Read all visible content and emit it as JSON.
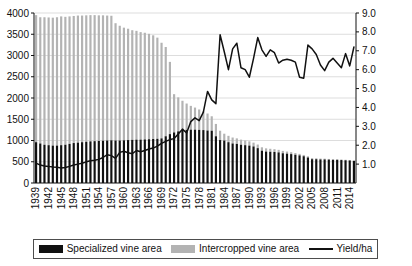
{
  "chart_data": {
    "type": "bar",
    "title": "",
    "subtitle": "",
    "xlabel": "",
    "ylabel": "",
    "y2label": "",
    "grid": true,
    "legend_position": "bottom",
    "stacked": true,
    "ylim": [
      0,
      4000
    ],
    "y2lim": [
      0,
      9.0
    ],
    "ytick_labels": [
      "0",
      "500",
      "1000",
      "1500",
      "2000",
      "2500",
      "3000",
      "3500",
      "4000"
    ],
    "ytick_values": [
      0,
      500,
      1000,
      1500,
      2000,
      2500,
      3000,
      3500,
      4000
    ],
    "y2tick_labels": [
      "1.0",
      "2.0",
      "3.0",
      "4.0",
      "5.0",
      "6.0",
      "7.0",
      "8.0",
      "9.0"
    ],
    "y2tick_values": [
      1.0,
      2.0,
      3.0,
      4.0,
      5.0,
      6.0,
      7.0,
      8.0,
      9.0
    ],
    "xtick_labels": [
      "1939",
      "1942",
      "1945",
      "1948",
      "1951",
      "1954",
      "1957",
      "1960",
      "1963",
      "1966",
      "1969",
      "1972",
      "1975",
      "1978",
      "1981",
      "1984",
      "1987",
      "1990",
      "1993",
      "1996",
      "1999",
      "2002",
      "2005",
      "2008",
      "2011",
      "2014"
    ],
    "categories": [
      1939,
      1940,
      1941,
      1942,
      1943,
      1944,
      1945,
      1946,
      1947,
      1948,
      1949,
      1950,
      1951,
      1952,
      1953,
      1954,
      1955,
      1956,
      1957,
      1958,
      1959,
      1960,
      1961,
      1962,
      1963,
      1964,
      1965,
      1966,
      1967,
      1968,
      1969,
      1970,
      1971,
      1972,
      1973,
      1974,
      1975,
      1976,
      1977,
      1978,
      1979,
      1980,
      1981,
      1982,
      1983,
      1984,
      1985,
      1986,
      1987,
      1988,
      1989,
      1990,
      1991,
      1992,
      1993,
      1994,
      1995,
      1996,
      1997,
      1998,
      1999,
      2000,
      2001,
      2002,
      2003,
      2004,
      2005,
      2006,
      2007,
      2008,
      2009,
      2010,
      2011,
      2012,
      2013,
      2014,
      2015
    ],
    "series": [
      {
        "name": "Specialized vine area",
        "color": "#111111",
        "axis": "left",
        "values": [
          960,
          930,
          900,
          890,
          880,
          880,
          890,
          900,
          920,
          940,
          950,
          960,
          970,
          980,
          985,
          990,
          995,
          1000,
          1005,
          1000,
          1000,
          1005,
          1010,
          1015,
          1020,
          1020,
          1025,
          1030,
          1035,
          1040,
          1050,
          1100,
          1150,
          1190,
          1215,
          1235,
          1250,
          1255,
          1255,
          1250,
          1245,
          1235,
          1230,
          1100,
          1010,
          1000,
          960,
          930,
          920,
          900,
          890,
          880,
          860,
          820,
          760,
          740,
          735,
          730,
          720,
          700,
          690,
          680,
          665,
          650,
          630,
          600,
          560,
          560,
          555,
          555,
          550,
          545,
          545,
          540,
          535,
          530,
          520
        ]
      },
      {
        "name": "Intercropped vine area",
        "color": "#b3b3b3",
        "axis": "left",
        "values": [
          2990,
          2970,
          3000,
          3005,
          3010,
          3020,
          3030,
          3010,
          3000,
          2990,
          2990,
          2980,
          2975,
          2970,
          2965,
          2955,
          2950,
          2940,
          2930,
          2760,
          2700,
          2650,
          2620,
          2580,
          2560,
          2530,
          2510,
          2480,
          2440,
          2380,
          2250,
          2100,
          1700,
          900,
          800,
          700,
          620,
          560,
          520,
          480,
          440,
          400,
          340,
          290,
          220,
          160,
          150,
          140,
          130,
          120,
          110,
          100,
          90,
          85,
          80,
          75,
          70,
          65,
          60,
          55,
          50,
          45,
          40,
          35,
          30,
          28,
          25,
          22,
          20,
          18,
          16,
          15,
          14,
          13,
          12,
          11,
          10
        ]
      },
      {
        "name": "Yield/ha",
        "color": "#111111",
        "axis": "right",
        "values": [
          1.05,
          0.95,
          0.9,
          0.88,
          0.85,
          0.83,
          0.8,
          0.82,
          0.88,
          0.95,
          1.0,
          1.05,
          1.12,
          1.18,
          1.2,
          1.25,
          1.35,
          1.5,
          1.45,
          1.3,
          1.62,
          1.68,
          1.6,
          1.55,
          1.72,
          1.65,
          1.72,
          1.8,
          1.85,
          1.95,
          2.1,
          2.2,
          2.3,
          2.35,
          2.6,
          2.85,
          2.65,
          3.25,
          3.45,
          3.3,
          3.75,
          4.85,
          4.4,
          4.2,
          7.85,
          6.95,
          6.0,
          7.1,
          7.4,
          6.1,
          6.0,
          5.6,
          6.6,
          7.7,
          7.05,
          6.7,
          7.05,
          6.9,
          6.35,
          6.5,
          6.55,
          6.5,
          6.4,
          5.6,
          5.55,
          7.3,
          7.1,
          6.8,
          6.25,
          5.95,
          6.4,
          6.6,
          6.35,
          6.1,
          6.85,
          6.2,
          7.2
        ]
      }
    ]
  },
  "legend": {
    "items": [
      {
        "label": "Specialized vine area",
        "type": "swatch",
        "color": "#111111"
      },
      {
        "label": "Intercropped vine area",
        "type": "swatch",
        "color": "#b3b3b3"
      },
      {
        "label": "Yield/ha",
        "type": "line",
        "color": "#111111"
      }
    ]
  }
}
